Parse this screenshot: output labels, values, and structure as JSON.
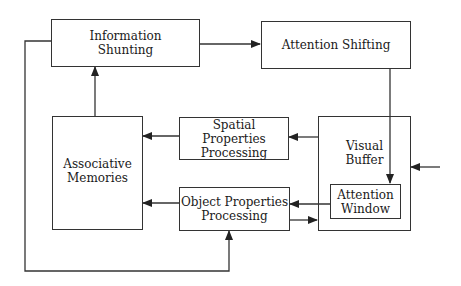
{
  "diagram": {
    "nodes": [
      {
        "id": "info_shunting",
        "label": "Information\nShunting"
      },
      {
        "id": "attention_shifting",
        "label": "Attention Shifting"
      },
      {
        "id": "associative_memories",
        "label": "Associative\nMemories"
      },
      {
        "id": "spatial_properties",
        "label": "Spatial Properties\nProcessing"
      },
      {
        "id": "object_properties",
        "label": "Object Properties\nProcessing"
      },
      {
        "id": "visual_buffer",
        "label": "Visual\nBuffer"
      },
      {
        "id": "attention_window",
        "label": "Attention\nWindow"
      }
    ],
    "edges": [
      {
        "from": "info_shunting",
        "to": "attention_shifting"
      },
      {
        "from": "attention_shifting",
        "to": "attention_window"
      },
      {
        "from": "associative_memories",
        "to": "info_shunting"
      },
      {
        "from": "spatial_properties",
        "to": "associative_memories"
      },
      {
        "from": "object_properties",
        "to": "associative_memories"
      },
      {
        "from": "visual_buffer",
        "to": "spatial_properties"
      },
      {
        "from": "attention_window",
        "to": "object_properties"
      },
      {
        "from": "object_properties",
        "to": "visual_buffer"
      },
      {
        "from": "info_shunting",
        "to": "object_properties"
      },
      {
        "from": "external_input",
        "to": "visual_buffer"
      }
    ]
  },
  "colors": {
    "stroke": "#333333",
    "text": "#1a1a1a",
    "background": "#ffffff"
  }
}
